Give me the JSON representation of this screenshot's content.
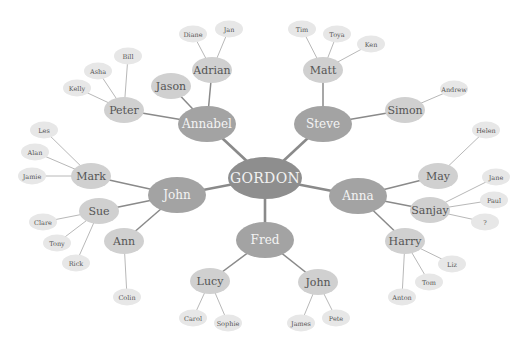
{
  "diagram": {
    "type": "mind-map",
    "colors": {
      "root": "#8e8e8e",
      "level1": "#a3a3a3",
      "level2": "#d0d0d0",
      "level3": "#e7e7e7",
      "link_strong": "#8a8a8a",
      "link_light": "#b8b8b8",
      "text_light": "#f4f4f4",
      "text_dark": "#555555"
    },
    "nodes": {
      "gordon": {
        "label": "GORDON",
        "x": 265,
        "y": 178,
        "w": 74,
        "h": 42
      },
      "annabel": {
        "label": "Annabel",
        "x": 207,
        "y": 124,
        "w": 58,
        "h": 36
      },
      "steve": {
        "label": "Steve",
        "x": 323,
        "y": 124,
        "w": 58,
        "h": 36
      },
      "john1": {
        "label": "John",
        "x": 177,
        "y": 195,
        "w": 58,
        "h": 36
      },
      "anna": {
        "label": "Anna",
        "x": 358,
        "y": 196,
        "w": 58,
        "h": 36
      },
      "fred": {
        "label": "Fred",
        "x": 265,
        "y": 240,
        "w": 58,
        "h": 36
      },
      "adrian": {
        "label": "Adrian",
        "x": 212,
        "y": 70,
        "w": 40,
        "h": 26
      },
      "jason": {
        "label": "Jason",
        "x": 171,
        "y": 86,
        "w": 40,
        "h": 26
      },
      "peter": {
        "label": "Peter",
        "x": 124,
        "y": 110,
        "w": 40,
        "h": 26
      },
      "matt": {
        "label": "Matt",
        "x": 323,
        "y": 70,
        "w": 40,
        "h": 26
      },
      "simon": {
        "label": "Simon",
        "x": 405,
        "y": 110,
        "w": 40,
        "h": 26
      },
      "mark": {
        "label": "Mark",
        "x": 91,
        "y": 176,
        "w": 40,
        "h": 26
      },
      "sue": {
        "label": "Sue",
        "x": 99,
        "y": 211,
        "w": 40,
        "h": 26
      },
      "ann": {
        "label": "Ann",
        "x": 124,
        "y": 241,
        "w": 40,
        "h": 26
      },
      "may": {
        "label": "May",
        "x": 438,
        "y": 176,
        "w": 40,
        "h": 26
      },
      "sanjay": {
        "label": "Sanjay",
        "x": 430,
        "y": 210,
        "w": 40,
        "h": 26
      },
      "harry": {
        "label": "Harry",
        "x": 405,
        "y": 241,
        "w": 40,
        "h": 26
      },
      "lucy": {
        "label": "Lucy",
        "x": 210,
        "y": 281,
        "w": 40,
        "h": 26
      },
      "john2": {
        "label": "John",
        "x": 318,
        "y": 282,
        "w": 40,
        "h": 26
      },
      "diane": {
        "label": "Diane",
        "x": 193,
        "y": 34,
        "w": 28,
        "h": 17
      },
      "jan": {
        "label": "Jan",
        "x": 229,
        "y": 29,
        "w": 28,
        "h": 17
      },
      "bill": {
        "label": "Bill",
        "x": 128,
        "y": 56,
        "w": 28,
        "h": 17
      },
      "asha": {
        "label": "Asha",
        "x": 98,
        "y": 71,
        "w": 28,
        "h": 17
      },
      "kelly": {
        "label": "Kelly",
        "x": 77,
        "y": 88,
        "w": 28,
        "h": 17
      },
      "tim": {
        "label": "Tim",
        "x": 302,
        "y": 29,
        "w": 28,
        "h": 17
      },
      "toya": {
        "label": "Toya",
        "x": 337,
        "y": 34,
        "w": 28,
        "h": 17
      },
      "ken": {
        "label": "Ken",
        "x": 371,
        "y": 44,
        "w": 28,
        "h": 17
      },
      "andrew": {
        "label": "Andrew",
        "x": 454,
        "y": 89,
        "w": 28,
        "h": 17
      },
      "helen": {
        "label": "Helen",
        "x": 486,
        "y": 130,
        "w": 28,
        "h": 17
      },
      "jane": {
        "label": "Jane",
        "x": 496,
        "y": 177,
        "w": 28,
        "h": 17
      },
      "paul": {
        "label": "Paul",
        "x": 494,
        "y": 200,
        "w": 28,
        "h": 17
      },
      "q": {
        "label": "?",
        "x": 485,
        "y": 222,
        "w": 28,
        "h": 17
      },
      "liz": {
        "label": "Liz",
        "x": 452,
        "y": 264,
        "w": 28,
        "h": 17
      },
      "tom": {
        "label": "Tom",
        "x": 429,
        "y": 282,
        "w": 28,
        "h": 17
      },
      "anton": {
        "label": "Anton",
        "x": 402,
        "y": 297,
        "w": 28,
        "h": 17
      },
      "les": {
        "label": "Les",
        "x": 44,
        "y": 130,
        "w": 28,
        "h": 17
      },
      "alan": {
        "label": "Alan",
        "x": 35,
        "y": 152,
        "w": 28,
        "h": 17
      },
      "jamie": {
        "label": "Jamie",
        "x": 32,
        "y": 176,
        "w": 28,
        "h": 17
      },
      "clare": {
        "label": "Clare",
        "x": 43,
        "y": 222,
        "w": 28,
        "h": 17
      },
      "tony": {
        "label": "Tony",
        "x": 57,
        "y": 243,
        "w": 28,
        "h": 17
      },
      "rick": {
        "label": "Rick",
        "x": 76,
        "y": 263,
        "w": 28,
        "h": 17
      },
      "colin": {
        "label": "Colin",
        "x": 127,
        "y": 297,
        "w": 28,
        "h": 17
      },
      "carol": {
        "label": "Carol",
        "x": 193,
        "y": 318,
        "w": 28,
        "h": 17
      },
      "sophie": {
        "label": "Sophie",
        "x": 228,
        "y": 323,
        "w": 28,
        "h": 17
      },
      "james": {
        "label": "James",
        "x": 301,
        "y": 323,
        "w": 28,
        "h": 17
      },
      "pete": {
        "label": "Pete",
        "x": 336,
        "y": 318,
        "w": 28,
        "h": 17
      }
    },
    "links": [
      [
        "gordon",
        "annabel",
        3
      ],
      [
        "gordon",
        "steve",
        3
      ],
      [
        "gordon",
        "john1",
        3
      ],
      [
        "gordon",
        "anna",
        3
      ],
      [
        "gordon",
        "fred",
        3
      ],
      [
        "annabel",
        "adrian",
        2
      ],
      [
        "annabel",
        "jason",
        2
      ],
      [
        "annabel",
        "peter",
        2
      ],
      [
        "steve",
        "matt",
        2
      ],
      [
        "steve",
        "simon",
        2
      ],
      [
        "john1",
        "mark",
        2
      ],
      [
        "john1",
        "sue",
        2
      ],
      [
        "john1",
        "ann",
        2
      ],
      [
        "anna",
        "may",
        2
      ],
      [
        "anna",
        "sanjay",
        2
      ],
      [
        "anna",
        "harry",
        2
      ],
      [
        "fred",
        "lucy",
        2
      ],
      [
        "fred",
        "john2",
        2
      ],
      [
        "adrian",
        "diane",
        1
      ],
      [
        "adrian",
        "jan",
        1
      ],
      [
        "peter",
        "bill",
        1
      ],
      [
        "peter",
        "asha",
        1
      ],
      [
        "peter",
        "kelly",
        1
      ],
      [
        "matt",
        "tim",
        1
      ],
      [
        "matt",
        "toya",
        1
      ],
      [
        "matt",
        "ken",
        1
      ],
      [
        "simon",
        "andrew",
        1
      ],
      [
        "may",
        "helen",
        1
      ],
      [
        "sanjay",
        "jane",
        1
      ],
      [
        "sanjay",
        "paul",
        1
      ],
      [
        "sanjay",
        "q",
        1
      ],
      [
        "harry",
        "liz",
        1
      ],
      [
        "harry",
        "tom",
        1
      ],
      [
        "harry",
        "anton",
        1
      ],
      [
        "mark",
        "les",
        1
      ],
      [
        "mark",
        "alan",
        1
      ],
      [
        "mark",
        "jamie",
        1
      ],
      [
        "sue",
        "clare",
        1
      ],
      [
        "sue",
        "tony",
        1
      ],
      [
        "sue",
        "rick",
        1
      ],
      [
        "ann",
        "colin",
        1
      ],
      [
        "lucy",
        "carol",
        1
      ],
      [
        "lucy",
        "sophie",
        1
      ],
      [
        "john2",
        "james",
        1
      ],
      [
        "john2",
        "pete",
        1
      ]
    ]
  }
}
